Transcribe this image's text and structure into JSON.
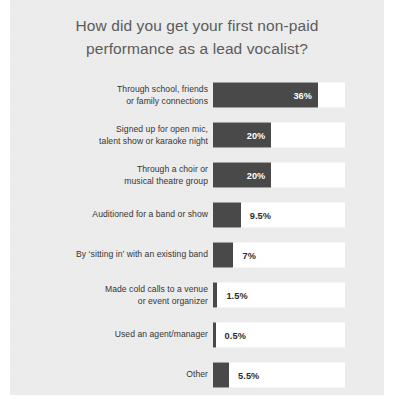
{
  "chart_data": {
    "type": "bar",
    "orientation": "horizontal",
    "title": "How did you get your first non-paid performance as a lead vocalist?",
    "title_lines": [
      "How did you get your first non-paid",
      "performance as a lead vocalist?"
    ],
    "xlabel": "",
    "ylabel": "",
    "xlim": [
      0,
      45
    ],
    "grid": false,
    "legend": null,
    "value_suffix": "%",
    "colors": {
      "bar": "#494949",
      "track": "#ffffff",
      "card_background": "#ececec",
      "title_text": "#5b5b5b",
      "label_text": "#353535",
      "value_text_inside": "#ffffff",
      "value_text_outside": "#2b2b2b"
    },
    "categories": [
      "Through school, friends or family connections",
      "Signed up for open mic, talent show or karaoke night",
      "Through a choir or musical theatre group",
      "Auditioned for a band or show",
      "By ‘sitting in’ with an existing band",
      "Made cold calls to a venue or event organizer",
      "Used an agent/manager",
      "Other"
    ],
    "values": [
      36,
      20,
      20,
      9.5,
      7,
      1.5,
      0.5,
      5.5
    ],
    "bars": [
      {
        "label_lines": [
          "Through school, friends",
          "or family connections"
        ],
        "value": 36,
        "value_label": "36%",
        "label_position": "inside"
      },
      {
        "label_lines": [
          "Signed up for open mic,",
          "talent show or karaoke night"
        ],
        "value": 20,
        "value_label": "20%",
        "label_position": "inside"
      },
      {
        "label_lines": [
          "Through a choir or",
          "musical theatre group"
        ],
        "value": 20,
        "value_label": "20%",
        "label_position": "inside"
      },
      {
        "label_lines": [
          "Auditioned for a band or show"
        ],
        "value": 9.5,
        "value_label": "9.5%",
        "label_position": "outside"
      },
      {
        "label_lines": [
          "By ‘sitting in’ with an existing band"
        ],
        "value": 7,
        "value_label": "7%",
        "label_position": "outside"
      },
      {
        "label_lines": [
          "Made cold calls to a venue",
          "or event organizer"
        ],
        "value": 1.5,
        "value_label": "1.5%",
        "label_position": "outside"
      },
      {
        "label_lines": [
          "Used an agent/manager"
        ],
        "value": 0.5,
        "value_label": "0.5%",
        "label_position": "outside"
      },
      {
        "label_lines": [
          "Other"
        ],
        "value": 5.5,
        "value_label": "5.5%",
        "label_position": "outside"
      }
    ]
  }
}
